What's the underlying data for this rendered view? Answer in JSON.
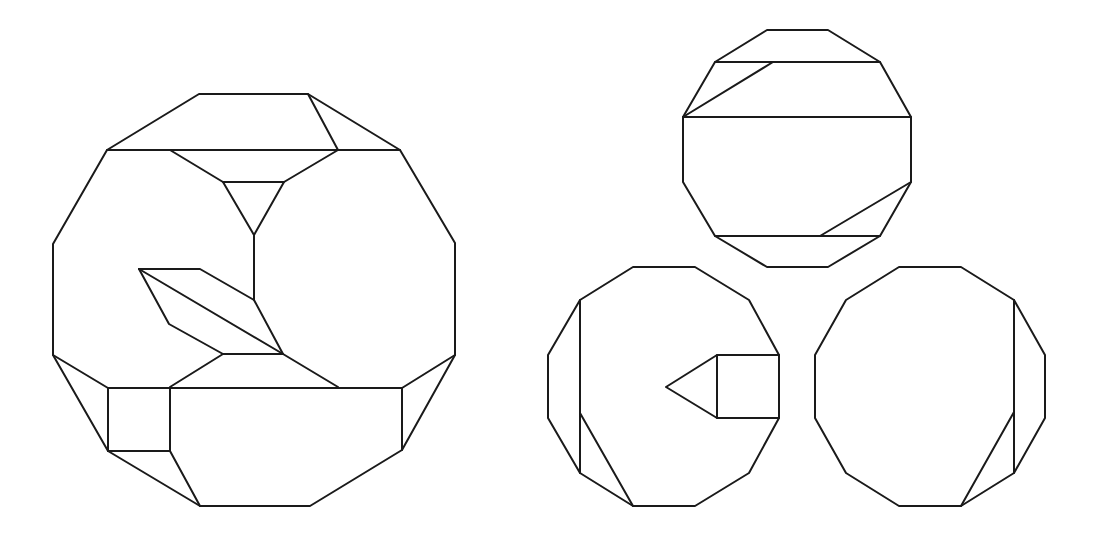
{
  "diagram": {
    "stroke_color": "#1a1a1a",
    "background": "#ffffff",
    "figures": [
      {
        "id": "large-figure",
        "outline": [
          [
            199,
            94
          ],
          [
            308,
            94
          ],
          [
            400,
            150
          ],
          [
            455,
            243
          ],
          [
            455,
            355
          ],
          [
            402,
            450
          ],
          [
            310,
            506
          ],
          [
            200,
            506
          ],
          [
            108,
            451
          ],
          [
            53,
            355
          ],
          [
            53,
            244
          ],
          [
            107,
            150
          ]
        ],
        "segments": [
          [
            [
              107,
              150
            ],
            [
              400,
              150
            ]
          ],
          [
            [
              308,
              94
            ],
            [
              338,
              150
            ]
          ],
          [
            [
              170,
              150
            ],
            [
              223,
              182
            ],
            [
              284,
              182
            ],
            [
              338,
              150
            ]
          ],
          [
            [
              223,
              182
            ],
            [
              254,
              235
            ],
            [
              284,
              182
            ]
          ],
          [
            [
              254,
              235
            ],
            [
              254,
              300
            ]
          ],
          [
            [
              139,
              269
            ],
            [
              200,
              269
            ],
            [
              254,
              300
            ],
            [
              283,
              354
            ],
            [
              338,
              387
            ]
          ],
          [
            [
              139,
              269
            ],
            [
              169,
              324
            ],
            [
              223,
              354
            ],
            [
              283,
              354
            ]
          ],
          [
            [
              139,
              269
            ],
            [
              283,
              354
            ]
          ],
          [
            [
              223,
              354
            ],
            [
              170,
              387
            ]
          ],
          [
            [
              53,
              355
            ],
            [
              108,
              388
            ],
            [
              108,
              451
            ]
          ],
          [
            [
              108,
              388
            ],
            [
              402,
              388
            ],
            [
              455,
              355
            ]
          ],
          [
            [
              170,
              388
            ],
            [
              170,
              451
            ],
            [
              108,
              451
            ]
          ],
          [
            [
              170,
              451
            ],
            [
              200,
              506
            ]
          ],
          [
            [
              402,
              388
            ],
            [
              402,
              450
            ]
          ]
        ]
      },
      {
        "id": "top-right-dodecagon",
        "outline": [
          [
            767,
            30
          ],
          [
            828,
            30
          ],
          [
            880,
            62
          ],
          [
            911,
            117
          ],
          [
            911,
            182
          ],
          [
            880,
            236
          ],
          [
            828,
            267
          ],
          [
            767,
            267
          ],
          [
            715,
            236
          ],
          [
            683,
            182
          ],
          [
            683,
            117
          ],
          [
            715,
            62
          ]
        ],
        "segments": [
          [
            [
              715,
              62
            ],
            [
              880,
              62
            ]
          ],
          [
            [
              683,
              117
            ],
            [
              911,
              117
            ]
          ],
          [
            [
              715,
              236
            ],
            [
              880,
              236
            ]
          ],
          [
            [
              683,
              117
            ],
            [
              773,
              62
            ]
          ],
          [
            [
              911,
              182
            ],
            [
              820,
              236
            ]
          ]
        ]
      },
      {
        "id": "bottom-left-dodecagon",
        "outline": [
          [
            633,
            267
          ],
          [
            695,
            267
          ],
          [
            749,
            300
          ],
          [
            779,
            355
          ],
          [
            779,
            418
          ],
          [
            749,
            473
          ],
          [
            695,
            506
          ],
          [
            633,
            506
          ],
          [
            580,
            473
          ],
          [
            548,
            418
          ],
          [
            548,
            355
          ],
          [
            580,
            300
          ]
        ],
        "segments": [
          [
            [
              580,
              300
            ],
            [
              580,
              473
            ]
          ],
          [
            [
              580,
              413
            ],
            [
              633,
              506
            ]
          ],
          [
            [
              779,
              355
            ],
            [
              717,
              355
            ],
            [
              666,
              387
            ],
            [
              717,
              418
            ],
            [
              779,
              418
            ]
          ],
          [
            [
              717,
              355
            ],
            [
              717,
              418
            ]
          ]
        ]
      },
      {
        "id": "bottom-right-dodecagon",
        "outline": [
          [
            899,
            267
          ],
          [
            961,
            267
          ],
          [
            1014,
            300
          ],
          [
            1045,
            355
          ],
          [
            1045,
            418
          ],
          [
            1014,
            473
          ],
          [
            961,
            506
          ],
          [
            899,
            506
          ],
          [
            846,
            473
          ],
          [
            815,
            418
          ],
          [
            815,
            355
          ],
          [
            846,
            300
          ]
        ],
        "segments": [
          [
            [
              1014,
              300
            ],
            [
              1014,
              473
            ]
          ],
          [
            [
              1014,
              412
            ],
            [
              961,
              506
            ]
          ]
        ]
      }
    ]
  }
}
